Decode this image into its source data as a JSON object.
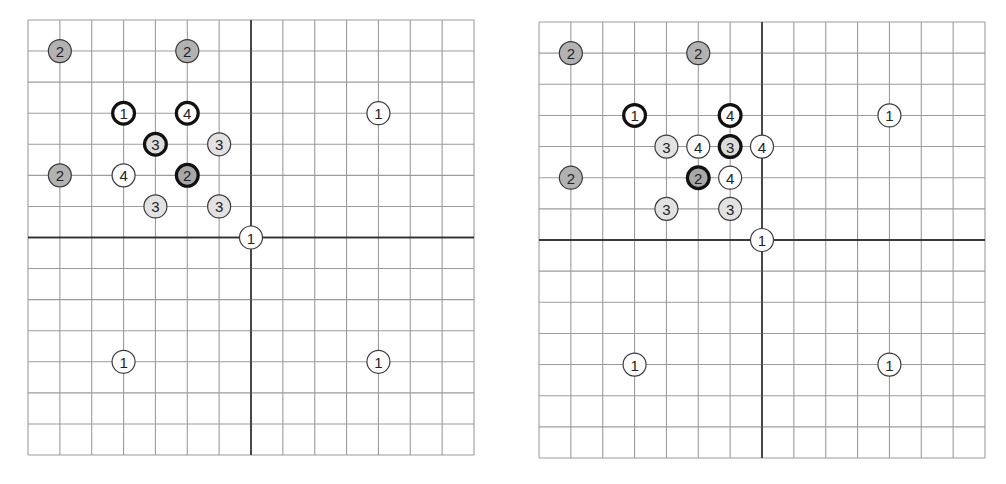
{
  "legend_styles": {
    "plain": {
      "fill": "#ffffff",
      "stroke": "#3a3a3a",
      "stroke_width": 1.2
    },
    "bold": {
      "fill": "#ffffff",
      "stroke": "#111111",
      "stroke_width": 3.2
    },
    "light": {
      "fill": "#e2e2e2",
      "stroke": "#3a3a3a",
      "stroke_width": 1.2
    },
    "light_bold": {
      "fill": "#dcdcdc",
      "stroke": "#111111",
      "stroke_width": 3.2
    },
    "medium": {
      "fill": "#b2b2b2",
      "stroke": "#3a3a3a",
      "stroke_width": 1.2
    },
    "medium_bold": {
      "fill": "#a8a8a8",
      "stroke": "#111111",
      "stroke_width": 3.2
    }
  },
  "panels": [
    {
      "name": "left-grid",
      "x": 27.5,
      "y": 20,
      "width": 446,
      "height": 435,
      "cols": 14,
      "rows": 14,
      "axis_col": 7,
      "axis_row": 7,
      "nodes": [
        {
          "col": 1,
          "row": 1,
          "label": "2",
          "style": "medium"
        },
        {
          "col": 5,
          "row": 1,
          "label": "2",
          "style": "medium"
        },
        {
          "col": 3,
          "row": 3,
          "label": "1",
          "style": "bold"
        },
        {
          "col": 5,
          "row": 3,
          "label": "4",
          "style": "bold"
        },
        {
          "col": 11,
          "row": 3,
          "label": "1",
          "style": "plain"
        },
        {
          "col": 4,
          "row": 4,
          "label": "3",
          "style": "light_bold"
        },
        {
          "col": 6,
          "row": 4,
          "label": "3",
          "style": "light"
        },
        {
          "col": 1,
          "row": 5,
          "label": "2",
          "style": "medium"
        },
        {
          "col": 3,
          "row": 5,
          "label": "4",
          "style": "plain"
        },
        {
          "col": 5,
          "row": 5,
          "label": "2",
          "style": "medium_bold"
        },
        {
          "col": 4,
          "row": 6,
          "label": "3",
          "style": "light"
        },
        {
          "col": 6,
          "row": 6,
          "label": "3",
          "style": "light"
        },
        {
          "col": 7,
          "row": 7,
          "label": "1",
          "style": "plain"
        },
        {
          "col": 3,
          "row": 11,
          "label": "1",
          "style": "plain"
        },
        {
          "col": 11,
          "row": 11,
          "label": "1",
          "style": "plain"
        }
      ]
    },
    {
      "name": "right-grid",
      "x": 539.3,
      "y": 22.3,
      "width": 446,
      "height": 436,
      "cols": 14,
      "rows": 14,
      "axis_col": 7,
      "axis_row": 7,
      "nodes": [
        {
          "col": 1,
          "row": 1,
          "label": "2",
          "style": "medium"
        },
        {
          "col": 5,
          "row": 1,
          "label": "2",
          "style": "medium"
        },
        {
          "col": 3,
          "row": 3,
          "label": "1",
          "style": "bold"
        },
        {
          "col": 6,
          "row": 3,
          "label": "4",
          "style": "bold"
        },
        {
          "col": 11,
          "row": 3,
          "label": "1",
          "style": "plain"
        },
        {
          "col": 4,
          "row": 4,
          "label": "3",
          "style": "light"
        },
        {
          "col": 5,
          "row": 4,
          "label": "4",
          "style": "plain"
        },
        {
          "col": 6,
          "row": 4,
          "label": "3",
          "style": "light_bold"
        },
        {
          "col": 7,
          "row": 4,
          "label": "4",
          "style": "plain"
        },
        {
          "col": 1,
          "row": 5,
          "label": "2",
          "style": "medium"
        },
        {
          "col": 5,
          "row": 5,
          "label": "2",
          "style": "medium_bold"
        },
        {
          "col": 6,
          "row": 5,
          "label": "4",
          "style": "plain"
        },
        {
          "col": 4,
          "row": 6,
          "label": "3",
          "style": "light"
        },
        {
          "col": 6,
          "row": 6,
          "label": "3",
          "style": "light"
        },
        {
          "col": 7,
          "row": 7,
          "label": "1",
          "style": "plain"
        },
        {
          "col": 3,
          "row": 11,
          "label": "1",
          "style": "plain"
        },
        {
          "col": 11,
          "row": 11,
          "label": "1",
          "style": "plain"
        }
      ]
    }
  ],
  "node_radius": 11.5
}
